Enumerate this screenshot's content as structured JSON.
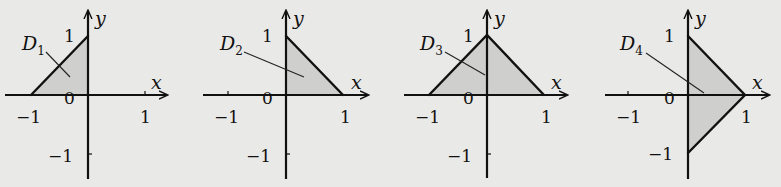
{
  "figure": {
    "fill_color": "#cfcfcd",
    "background_color": "#e9e9e7",
    "axis_labels": {
      "x": "x",
      "y": "y"
    },
    "tick_labels": {
      "neg_one": "−1",
      "one": "1",
      "zero": "0"
    },
    "panels": [
      {
        "id": "D1",
        "label": "D",
        "subscript": "1",
        "vertices": [
          [
            -1,
            0
          ],
          [
            0,
            1
          ],
          [
            0,
            0
          ]
        ],
        "description": "Triangle with vertices (-1,0), (0,1), (0,0)"
      },
      {
        "id": "D2",
        "label": "D",
        "subscript": "2",
        "vertices": [
          [
            0,
            0
          ],
          [
            0,
            1
          ],
          [
            1,
            0
          ]
        ],
        "description": "Triangle with vertices (0,0), (0,1), (1,0)"
      },
      {
        "id": "D3",
        "label": "D",
        "subscript": "3",
        "vertices": [
          [
            -1,
            0
          ],
          [
            0,
            1
          ],
          [
            1,
            0
          ]
        ],
        "description": "Triangle with vertices (-1,0), (0,1), (1,0)"
      },
      {
        "id": "D4",
        "label": "D",
        "subscript": "4",
        "vertices": [
          [
            0,
            1
          ],
          [
            1,
            0
          ],
          [
            0,
            -1
          ]
        ],
        "description": "Triangle with vertices (0,1), (1,0), (0,-1)"
      }
    ]
  }
}
